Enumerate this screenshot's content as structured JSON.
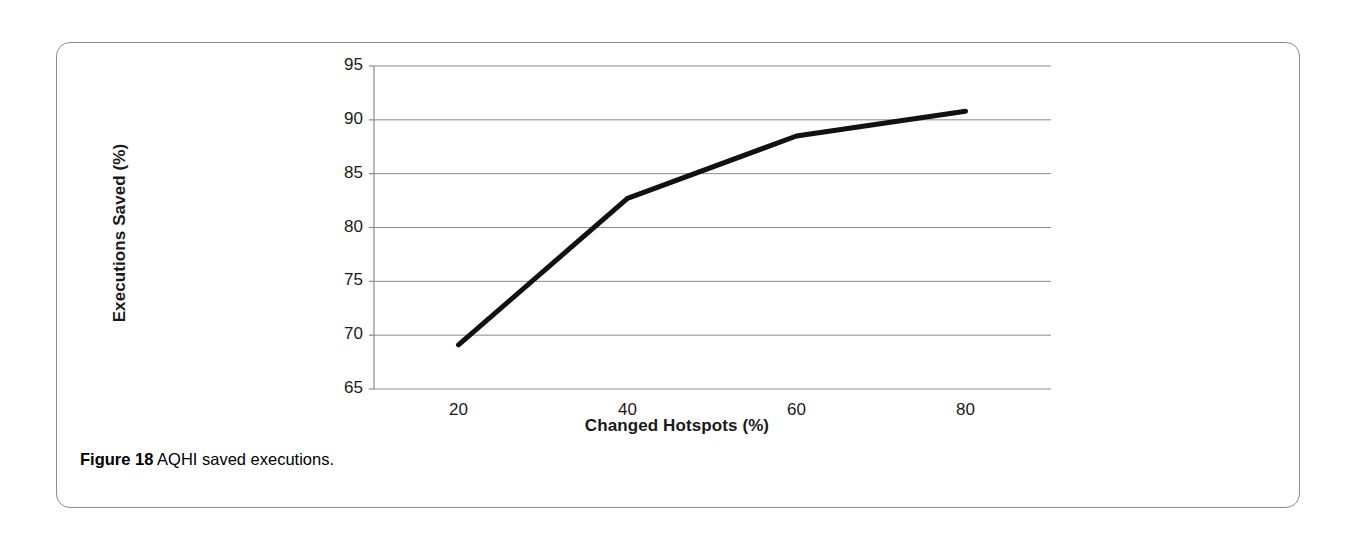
{
  "figure": {
    "caption_label": "Figure 18",
    "caption_text": "AQHI saved executions."
  },
  "colors": {
    "line": "#111111",
    "gridline": "#8a8a8a",
    "axis": "#8a8a8a",
    "panel_border": "#8c8c8c",
    "text": "#1a1a1a",
    "background": "#ffffff"
  },
  "chart_data": {
    "type": "line",
    "title": "",
    "subtitle": "",
    "xlabel": "Changed Hotspots (%)",
    "ylabel": "Executions Saved (%)",
    "x": [
      20,
      40,
      60,
      80
    ],
    "values": [
      69.1,
      82.7,
      88.5,
      90.8
    ],
    "series": [
      {
        "name": "AQHI saved executions",
        "x": [
          20,
          40,
          60,
          80
        ],
        "values": [
          69.1,
          82.7,
          88.5,
          90.8
        ]
      }
    ],
    "xlim": [
      10,
      90
    ],
    "ylim": [
      65,
      95
    ],
    "xticks": [
      20,
      40,
      60,
      80
    ],
    "xtick_labels": [
      "20",
      "40",
      "60",
      "80"
    ],
    "yticks": [
      65,
      70,
      75,
      80,
      85,
      90,
      95
    ],
    "ytick_labels": [
      "65",
      "70",
      "75",
      "80",
      "85",
      "90",
      "95"
    ],
    "grid": true,
    "grid_axis": "y",
    "legend": false,
    "legend_position": "none",
    "annotations": [],
    "markers": false,
    "line_width": 5
  }
}
